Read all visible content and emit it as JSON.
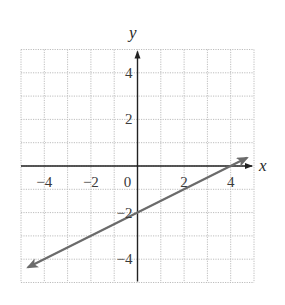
{
  "chart_data": {
    "type": "line",
    "title": "",
    "xlabel": "x",
    "ylabel": "y",
    "xlim": [
      -5,
      5
    ],
    "ylim": [
      -5,
      5
    ],
    "grid": true,
    "grid_style": "dotted",
    "grid_step": 1,
    "x_ticks": [
      {
        "value": -4,
        "label": "−4"
      },
      {
        "value": -2,
        "label": "−2"
      },
      {
        "value": 0,
        "label": "0"
      },
      {
        "value": 2,
        "label": "2"
      },
      {
        "value": 4,
        "label": "4"
      }
    ],
    "y_ticks": [
      {
        "value": 4,
        "label": "4"
      },
      {
        "value": 2,
        "label": "2"
      },
      {
        "value": -2,
        "label": "−2"
      },
      {
        "value": -4,
        "label": "−4"
      }
    ],
    "series": [
      {
        "name": "line",
        "equation": "y = x/2 - 2",
        "slope": 0.5,
        "intercept": -2,
        "x": [
          -4.7,
          0,
          4,
          4.7
        ],
        "y": [
          -4.35,
          -2,
          0,
          0.35
        ],
        "arrows": "both",
        "color": "#6b6b6b"
      }
    ],
    "legend": null
  },
  "colors": {
    "grid": "#bdbdbd",
    "axis": "#222222",
    "line": "#6b6b6b",
    "text": "#3a3a3a"
  }
}
